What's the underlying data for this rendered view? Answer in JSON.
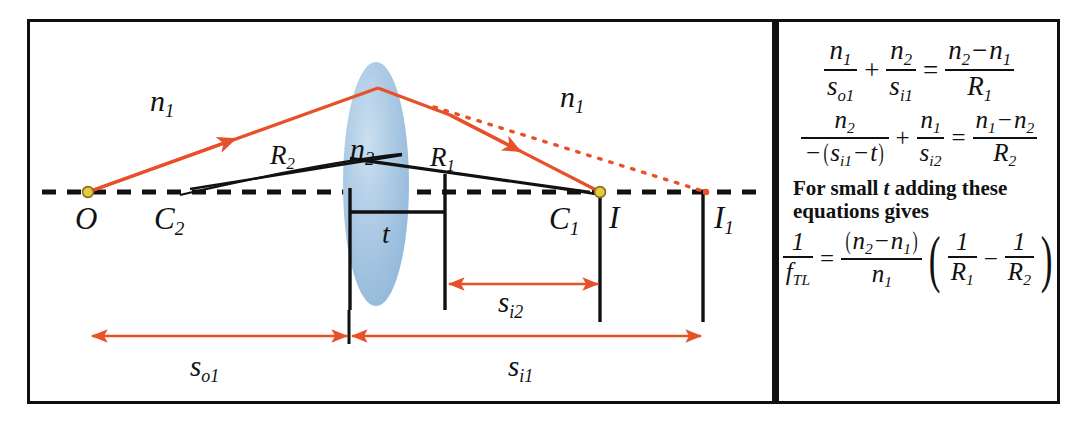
{
  "figure": {
    "colors": {
      "ray": "#E8502A",
      "lens_fill": "#A8C6E2",
      "lens_fill_light": "#C9DDEF",
      "axis": "#111111",
      "frame": "#101010",
      "point_dot": "#E8C84A"
    }
  },
  "diagram": {
    "media": {
      "left_index": {
        "base": "n",
        "sub": "1"
      },
      "right_index": {
        "base": "n",
        "sub": "1"
      },
      "lens_index": {
        "base": "n",
        "sub": "2"
      }
    },
    "points": {
      "object": {
        "label": "O",
        "sub": ""
      },
      "center_2": {
        "label": "C",
        "sub": "2"
      },
      "center_1": {
        "label": "C",
        "sub": "1"
      },
      "image": {
        "label": "I",
        "sub": ""
      },
      "image_1": {
        "label": "I",
        "sub": "1"
      }
    },
    "radii": {
      "r2": {
        "base": "R",
        "sub": "2"
      },
      "r1": {
        "base": "R",
        "sub": "1"
      }
    },
    "thickness": {
      "base": "t",
      "sub": ""
    },
    "distances": {
      "s_o1": {
        "base": "s",
        "sub": "o1"
      },
      "s_i1": {
        "base": "s",
        "sub": "i1"
      },
      "s_i2": {
        "base": "s",
        "sub": "i2"
      }
    }
  },
  "equations": {
    "eq1": {
      "lhs_term1": {
        "num_base": "n",
        "num_sub": "1",
        "den_base": "s",
        "den_sub": "o1"
      },
      "plus": "+",
      "lhs_term2": {
        "num_base": "n",
        "num_sub": "2",
        "den_base": "s",
        "den_sub": "i1"
      },
      "equals": "=",
      "rhs": {
        "num_a_base": "n",
        "num_a_sub": "2",
        "minus": "−",
        "num_b_base": "n",
        "num_b_sub": "1",
        "den_base": "R",
        "den_sub": "1"
      }
    },
    "eq2": {
      "lhs_term1": {
        "num_base": "n",
        "num_sub": "2",
        "den_minus": "−",
        "den_open": "(",
        "den_base": "s",
        "den_sub": "i1",
        "den_minus2": "−",
        "den_t": "t",
        "den_close": ")"
      },
      "plus": "+",
      "lhs_term2": {
        "num_base": "n",
        "num_sub": "1",
        "den_base": "s",
        "den_sub": "i2"
      },
      "equals": "=",
      "rhs": {
        "num_a_base": "n",
        "num_a_sub": "1",
        "minus": "−",
        "num_b_base": "n",
        "num_b_sub": "2",
        "den_base": "R",
        "den_sub": "2"
      }
    },
    "note_line1_pre": "For small ",
    "note_line1_it": "t",
    "note_line1_post": " adding these",
    "note_line2": "equations gives",
    "eq3": {
      "lhs": {
        "num": "1",
        "den_base": "f",
        "den_sub": "TL"
      },
      "equals": "=",
      "frac": {
        "open": "(",
        "num_a_base": "n",
        "num_a_sub": "2",
        "minus": "−",
        "num_b_base": "n",
        "num_b_sub": "1",
        "close": ")",
        "den_base": "n",
        "den_sub": "1"
      },
      "group_open": "(",
      "term1": {
        "num": "1",
        "den_base": "R",
        "den_sub": "1"
      },
      "group_minus": "−",
      "term2": {
        "num": "1",
        "den_base": "R",
        "den_sub": "2"
      },
      "group_close": ")"
    }
  }
}
